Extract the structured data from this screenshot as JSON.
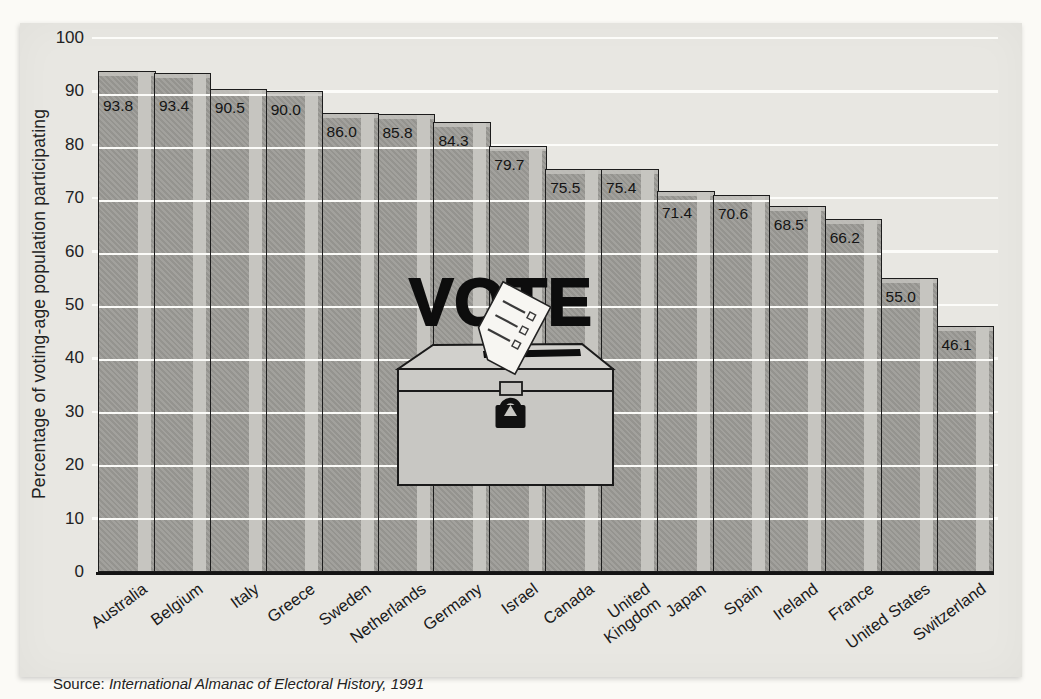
{
  "colors": {
    "page_background": "#fbfaf6",
    "panel_background": "#e8e7e2",
    "bar_fill": "#9d9c97",
    "bar_highlight_stripe": "#c6c5c0",
    "bar_border": "#1c1c1c",
    "gridline": "#fcfcf9",
    "text": "#1a1a1a"
  },
  "chart_data": {
    "type": "bar",
    "title": "",
    "ylabel": "Percentage of voting-age population participating",
    "xlabel": "",
    "ylim": [
      0,
      100
    ],
    "yticks": [
      0,
      10,
      20,
      30,
      40,
      50,
      60,
      70,
      80,
      90,
      100
    ],
    "grid": "horizontal white lines every 10 units drawn across bars",
    "legend": null,
    "categories": [
      "Australia",
      "Belgium",
      "Italy",
      "Greece",
      "Sweden",
      "Netherlands",
      "Germany",
      "Israel",
      "Canada",
      "United Kingdom",
      "Japan",
      "Spain",
      "Ireland",
      "France",
      "United States",
      "Switzerland"
    ],
    "values": [
      93.8,
      93.4,
      90.5,
      90.0,
      86.0,
      85.8,
      84.3,
      79.7,
      75.5,
      75.4,
      71.4,
      70.6,
      68.5,
      66.2,
      55.0,
      46.1
    ],
    "value_labels": [
      "93.8",
      "93.4",
      "90.5",
      "90.0",
      "86.0",
      "85.8",
      "84.3",
      "79.7",
      "75.5",
      "75.4",
      "71.4",
      "70.6",
      "68.5",
      "66.2",
      "55.0",
      "46.1"
    ],
    "footnote_marks": [
      "",
      "",
      "",
      "",
      "",
      "",
      "",
      "",
      "",
      "",
      "",
      "",
      "*",
      "",
      "",
      ""
    ],
    "wrap_labels": [
      "United Kingdom"
    ],
    "x_label_rotation_deg": -36
  },
  "decoration": {
    "vote_word": "VOTE",
    "ballot_paper_lines": 3
  },
  "source": {
    "prefix": "Source: ",
    "title": "International Almanac of Electoral History, 1991"
  }
}
